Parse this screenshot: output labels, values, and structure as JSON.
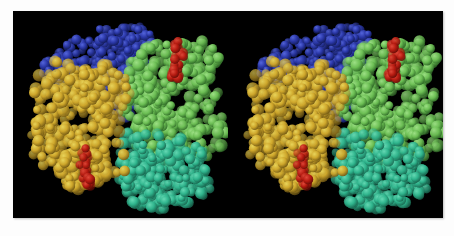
{
  "figure": {
    "caption": "",
    "background_color": "#ffffff",
    "panel_color": "#000000",
    "panel": {
      "x": 13,
      "y": 11,
      "width": 430,
      "height": 207
    },
    "view_type": "stereo-pair",
    "views": [
      {
        "name": "left-eye-view",
        "label": ""
      },
      {
        "name": "right-eye-view",
        "label": ""
      }
    ]
  },
  "molecule": {
    "name": "Hemoglobin",
    "representation": "space-filling (CPK spheres)",
    "subunit_count": 4,
    "ligand_count": 4,
    "visible_ligand_count": 2,
    "subunits": [
      {
        "id": "alpha-1",
        "label": "",
        "color": "#cfa72b",
        "highlight_color": "#e8d45a",
        "shadow_color": "#7a5f15",
        "position": "left-lower",
        "sphere_count": 430
      },
      {
        "id": "beta-1",
        "label": "",
        "color": "#2a37a8",
        "highlight_color": "#5566dd",
        "shadow_color": "#141d5e",
        "position": "top-left",
        "sphere_count": 300
      },
      {
        "id": "alpha-2",
        "label": "",
        "color": "#6cbf54",
        "highlight_color": "#9de085",
        "shadow_color": "#33702a",
        "position": "right-upper",
        "sphere_count": 430
      },
      {
        "id": "beta-2",
        "label": "",
        "color": "#2eb48c",
        "highlight_color": "#66d9b4",
        "shadow_color": "#1a6b53",
        "position": "bottom-right",
        "sphere_count": 300
      }
    ],
    "ligands": [
      {
        "id": "heme-green-subunit",
        "label": "",
        "color": "#b51a10",
        "highlight_color": "#e04a3a",
        "shadow_color": "#6b0d06",
        "position": "upper-right",
        "sphere_count": 26
      },
      {
        "id": "heme-gold-subunit",
        "label": "",
        "color": "#b51a10",
        "highlight_color": "#e04a3a",
        "shadow_color": "#6b0d06",
        "position": "lower-left",
        "sphere_count": 26
      }
    ]
  },
  "colors": {
    "background": "#ffffff",
    "panel": "#000000",
    "gold": "#cfa72b",
    "blue": "#2a37a8",
    "green": "#6cbf54",
    "teal": "#2eb48c",
    "red": "#b51a10"
  }
}
